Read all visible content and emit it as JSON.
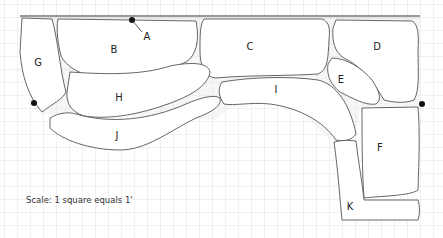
{
  "diagram": {
    "type": "garden bed layout plan on graph paper",
    "scale_note": "Scale: 1 square equals 1'",
    "grid": {
      "cell_px": 13,
      "line_color": "#d9d9d9",
      "background": "#ffffff"
    },
    "beds": [
      {
        "id": "A",
        "label": "A",
        "note": "pointer to small marker at top wall"
      },
      {
        "id": "B",
        "label": "B"
      },
      {
        "id": "C",
        "label": "C"
      },
      {
        "id": "D",
        "label": "D"
      },
      {
        "id": "E",
        "label": "E"
      },
      {
        "id": "F",
        "label": "F"
      },
      {
        "id": "G",
        "label": "G"
      },
      {
        "id": "H",
        "label": "H"
      },
      {
        "id": "I",
        "label": "I"
      },
      {
        "id": "J",
        "label": "J"
      },
      {
        "id": "K",
        "label": "K"
      }
    ],
    "markers": [
      {
        "name": "top-marker",
        "near": "A"
      },
      {
        "name": "left-marker",
        "near": "G"
      },
      {
        "name": "right-marker",
        "near": "D/F"
      }
    ],
    "colors": {
      "outline": "#555555",
      "gravel": "#e6e6e6",
      "marker": "#111111",
      "wall": "#777777"
    }
  }
}
